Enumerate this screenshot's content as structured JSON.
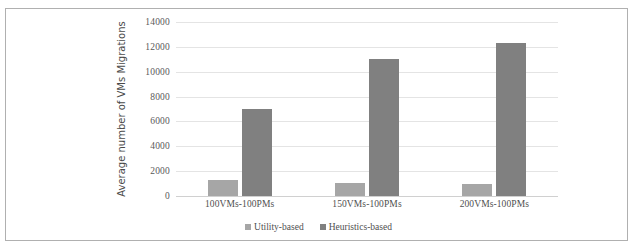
{
  "chart_data": {
    "type": "bar",
    "title": "",
    "xlabel": "",
    "ylabel": "Average number of VMs Migrations",
    "categories": [
      "100VMs-100PMs",
      "150VMs-100PMs",
      "200VMs-100PMs"
    ],
    "series": [
      {
        "name": "Utility-based",
        "color": "#a6a6a6",
        "values": [
          1300,
          1050,
          980
        ]
      },
      {
        "name": "Heuristics-based",
        "color": "#808080",
        "values": [
          7000,
          11050,
          12300
        ]
      }
    ],
    "ylim": [
      0,
      14000
    ],
    "yticks": [
      0,
      2000,
      4000,
      6000,
      8000,
      10000,
      12000,
      14000
    ],
    "ytick_labels": [
      "0",
      "2000",
      "4000",
      "6000",
      "8000",
      "10000",
      "12000",
      "14000"
    ],
    "grid": true,
    "legend_position": "bottom-center"
  }
}
